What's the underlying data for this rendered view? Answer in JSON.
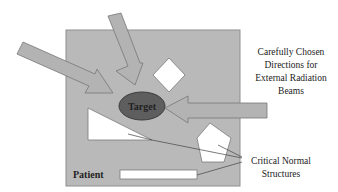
{
  "diagram": {
    "patient_label": "Patient",
    "target_label": "Target",
    "beams_caption": {
      "lines": [
        "Carefully Chosen",
        "Directions for",
        "External Radiation",
        "Beams"
      ]
    },
    "structures_caption": {
      "lines": [
        "Critical Normal",
        "Structures"
      ]
    },
    "colors": {
      "patient_body": "#b9b9b9",
      "patient_border": "#8f8f8f",
      "target_fill": "#5e5e5e",
      "target_border": "#3c3c3c",
      "beam_fill": "#b3b3b3",
      "beam_border": "#777777",
      "structure_fill": "#ffffff",
      "leader_line": "#444444"
    },
    "beams": [
      {
        "name": "beam-upper-left",
        "direction": "from upper-left toward target"
      },
      {
        "name": "beam-top",
        "direction": "from top toward target"
      },
      {
        "name": "beam-right",
        "direction": "from right toward target"
      }
    ],
    "critical_structures": [
      {
        "name": "triangle-structure",
        "shape": "triangle"
      },
      {
        "name": "diamond-structure",
        "shape": "diamond"
      },
      {
        "name": "pentagon-structure",
        "shape": "pentagon"
      },
      {
        "name": "bar-structure",
        "shape": "rectangle"
      }
    ]
  }
}
